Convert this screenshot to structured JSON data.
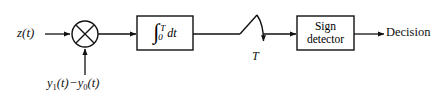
{
  "diagram": {
    "type": "block-diagram",
    "background_color": "#ffffff",
    "line_color": "#111111",
    "labels": {
      "input_signal": "z(t)",
      "reference_signal_y1": "y",
      "reference_signal_y1_sub": "1",
      "reference_signal_y1_arg": "(t)",
      "reference_signal_minus": "−",
      "reference_signal_y0": "y",
      "reference_signal_y0_sub": "0",
      "reference_signal_y0_arg": "(t)",
      "sampling_instant": "T",
      "output": "Decision"
    },
    "blocks": [
      {
        "name": "multiplier",
        "shape": "circle-with-cross",
        "label": "×",
        "cx": 85,
        "cy": 34,
        "r": 13
      },
      {
        "name": "integrator",
        "shape": "rectangle",
        "integral_symbol": "∫",
        "upper_limit": "T",
        "lower_limit": "0",
        "differential": "dt",
        "x": 137,
        "y": 16,
        "width": 56,
        "height": 34
      },
      {
        "name": "sampler-switch",
        "shape": "switch",
        "label": "T",
        "x": 236,
        "y": 14
      },
      {
        "name": "sign-detector",
        "shape": "rectangle",
        "line1": "Sign",
        "line2": "detector",
        "x": 297,
        "y": 16,
        "width": 57,
        "height": 34
      }
    ],
    "connections": [
      {
        "from": "input",
        "to": "multiplier"
      },
      {
        "from": "reference-signal",
        "to": "multiplier"
      },
      {
        "from": "multiplier",
        "to": "integrator"
      },
      {
        "from": "integrator",
        "to": "sampler-switch"
      },
      {
        "from": "sampler-switch",
        "to": "sign-detector"
      },
      {
        "from": "sign-detector",
        "to": "output"
      }
    ]
  }
}
